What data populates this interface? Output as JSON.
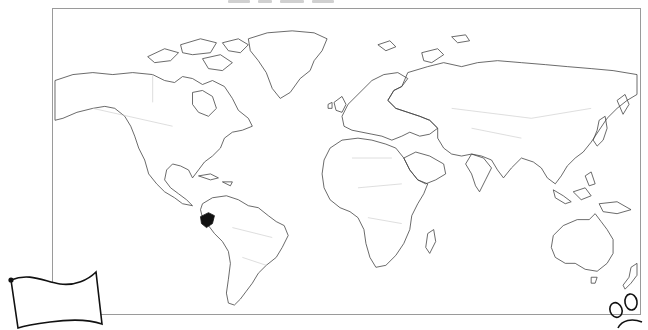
{
  "worksheet": {
    "type": "blank world outline map",
    "highlighted_country": "Ecuador",
    "highlight_color": "#111111",
    "outline_color": "#444444",
    "border_color": "#c8c8c8",
    "frame_color": "#9a9a9a"
  },
  "map": {
    "projection": "equirectangular-like",
    "continents": [
      "North America",
      "South America",
      "Europe",
      "Africa",
      "Asia",
      "Australia",
      "Greenland"
    ]
  },
  "decorations": {
    "flag": "blank-flag-outline",
    "paw": "paw-print-outline"
  }
}
